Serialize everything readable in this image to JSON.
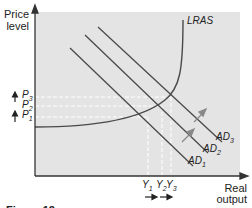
{
  "diagram": {
    "y_axis_label_line1": "Price",
    "y_axis_label_line2": "level",
    "x_axis_label_line1": "Real",
    "x_axis_label_line2": "output",
    "curves": {
      "lras": "LRAS",
      "ad1_base": "AD",
      "ad1_sub": "1",
      "ad2_base": "AD",
      "ad2_sub": "2",
      "ad3_base": "AD",
      "ad3_sub": "3"
    },
    "price_levels": [
      {
        "base": "P",
        "sub": "3"
      },
      {
        "base": "P",
        "sub": "2"
      },
      {
        "base": "P",
        "sub": "1"
      }
    ],
    "output_levels": [
      {
        "base": "Y",
        "sub": "1"
      },
      {
        "base": "Y",
        "sub": "2"
      },
      {
        "base": "Y",
        "sub": "3"
      }
    ],
    "caption": "Figure 12",
    "colors": {
      "plot_bg": "#e4e4e4",
      "line": "#4a4a4a",
      "dashed": "#ffffff",
      "text": "#222222"
    }
  }
}
